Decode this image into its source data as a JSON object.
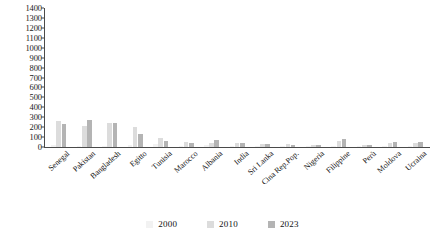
{
  "chart_data": {
    "type": "bar",
    "title": "",
    "xlabel": "",
    "ylabel": "",
    "ylim": [
      0,
      1400
    ],
    "yticks": [
      0,
      100,
      200,
      300,
      400,
      500,
      600,
      700,
      800,
      900,
      1000,
      1100,
      1200,
      1300,
      1400
    ],
    "grid": false,
    "legend_position": "bottom",
    "categories": [
      "Senegal",
      "Pakistan",
      "Bangladesh",
      "Egitto",
      "Tunisia",
      "Marocco",
      "Albania",
      "India",
      "Sri Lanka",
      "Cina Rep.Pop.",
      "Nigeria",
      "Filippine",
      "Perù",
      "Moldova",
      "Ucraina"
    ],
    "series": [
      {
        "name": "2000",
        "color": "#f2f2f2",
        "values": [
          20,
          15,
          12,
          18,
          30,
          10,
          25,
          8,
          6,
          5,
          4,
          12,
          10,
          5,
          8
        ]
      },
      {
        "name": "2010",
        "color": "#dcdcdc",
        "values": [
          265,
          210,
          240,
          200,
          95,
          55,
          40,
          45,
          35,
          30,
          20,
          65,
          25,
          40,
          45
        ]
      },
      {
        "name": "2023",
        "color": "#b4b4b4",
        "values": [
          230,
          270,
          245,
          130,
          60,
          45,
          75,
          40,
          28,
          25,
          18,
          80,
          22,
          50,
          55
        ]
      }
    ]
  },
  "legend": {
    "items": [
      {
        "label": "2000"
      },
      {
        "label": "2010"
      },
      {
        "label": "2023"
      }
    ]
  }
}
